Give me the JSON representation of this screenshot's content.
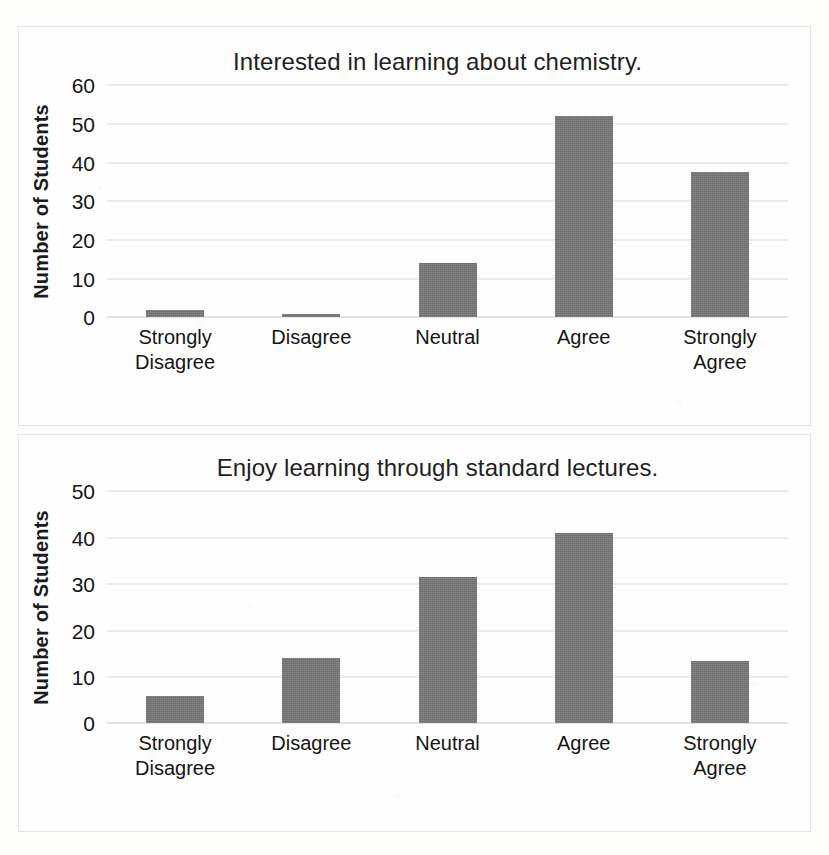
{
  "page": {
    "background_color": "#fdfdfc",
    "bar_color": "#767676",
    "gridline_color": "#d8d8d6"
  },
  "chart_data": [
    {
      "id": "interested-chemistry",
      "type": "bar",
      "title": "Interested in learning about chemistry.",
      "xlabel": "",
      "ylabel": "Number of Students",
      "categories": [
        "Strongly Disagree",
        "Disagree",
        "Neutral",
        "Agree",
        "Strongly Agree"
      ],
      "category_lines": [
        [
          "Strongly",
          "Disagree"
        ],
        [
          "Disagree",
          ""
        ],
        [
          "Neutral",
          ""
        ],
        [
          "Agree",
          ""
        ],
        [
          "Strongly",
          "Agree"
        ]
      ],
      "values": [
        2,
        1,
        14,
        52,
        37.5
      ],
      "yticks": [
        60,
        50,
        40,
        30,
        20,
        10,
        0
      ],
      "ylim": [
        0,
        60
      ],
      "grid": true,
      "legend": false
    },
    {
      "id": "enjoy-standard-lectures",
      "type": "bar",
      "title": "Enjoy learning through standard lectures.",
      "xlabel": "",
      "ylabel": "Number of Students",
      "categories": [
        "Strongly Disagree",
        "Disagree",
        "Neutral",
        "Agree",
        "Strongly Agree"
      ],
      "category_lines": [
        [
          "Strongly",
          "Disagree"
        ],
        [
          "Disagree",
          ""
        ],
        [
          "Neutral",
          ""
        ],
        [
          "Agree",
          ""
        ],
        [
          "Strongly",
          "Agree"
        ]
      ],
      "values": [
        6,
        14,
        31.5,
        41,
        13.5
      ],
      "yticks": [
        50,
        40,
        30,
        20,
        10,
        0
      ],
      "ylim": [
        0,
        50
      ],
      "grid": true,
      "legend": false
    }
  ]
}
